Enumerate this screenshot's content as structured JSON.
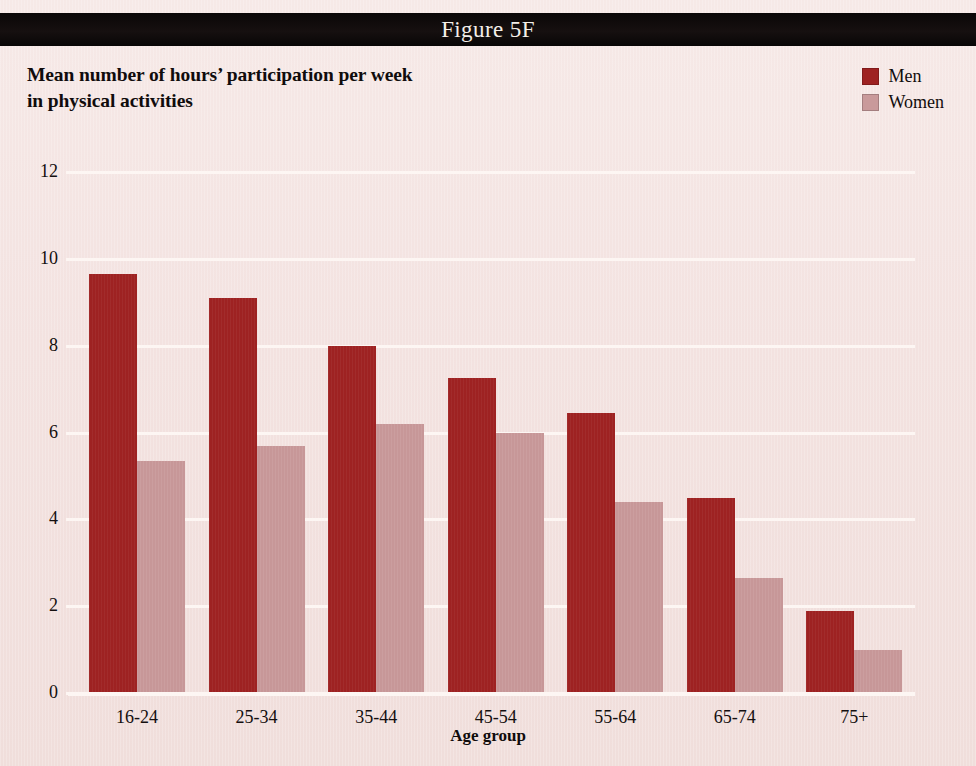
{
  "figure": {
    "number_label": "Figure 5F",
    "title_line1": "Mean number of hours’ participation per week",
    "title_line2": "in physical activities"
  },
  "legend": {
    "position": "top-right",
    "items": [
      {
        "label": "Men",
        "color": "#9e2222"
      },
      {
        "label": "Women",
        "color": "#c79798"
      }
    ]
  },
  "colors": {
    "background": "#f3e3e1",
    "header_band": "#0d0909",
    "gridline": "#fdf6f3",
    "men": "#9e2222",
    "women": "#c79798",
    "text": "#120d0d"
  },
  "axes": {
    "y_ticks": [
      "0",
      "2",
      "4",
      "6",
      "8",
      "10",
      "12"
    ],
    "y_title": "Mean number of hours",
    "x_title": "Age group"
  },
  "chart_data": {
    "type": "bar",
    "title": "Mean number of hours’ participation per week in physical activities",
    "subtitle": "Figure 5F",
    "xlabel": "Age group",
    "ylabel": "Mean number of hours",
    "ylim": [
      0,
      12
    ],
    "ytick_values": [
      0,
      2,
      4,
      6,
      8,
      10,
      12
    ],
    "grid": true,
    "legend_position": "top-right",
    "categories": [
      "16-24",
      "25-34",
      "35-44",
      "45-54",
      "55-64",
      "65-74",
      "75+"
    ],
    "series": [
      {
        "name": "Men",
        "color": "#9e2222",
        "values": [
          9.65,
          9.1,
          8.0,
          7.25,
          6.45,
          4.5,
          1.9
        ]
      },
      {
        "name": "Women",
        "color": "#c79798",
        "values": [
          5.35,
          5.7,
          6.2,
          6.0,
          4.4,
          2.65,
          1.0
        ]
      }
    ]
  }
}
